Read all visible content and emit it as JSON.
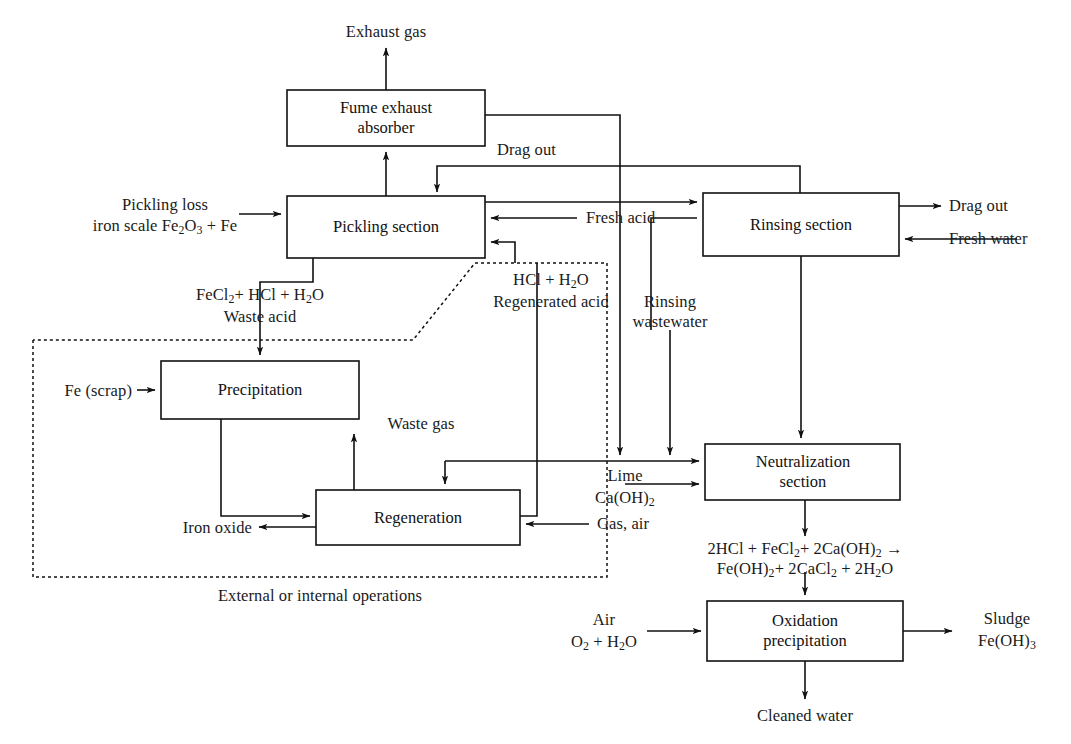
{
  "diagram": {
    "type": "process-flow-diagram",
    "colors": {
      "line": "#111111",
      "text": "#1a1a1a",
      "background": "#ffffff"
    },
    "boxes": [
      {
        "id": "fume-exhaust-absorber",
        "label_line1": "Fume exhaust",
        "label_line2": "absorber",
        "x": 287,
        "y": 90,
        "w": 198,
        "h": 56
      },
      {
        "id": "pickling-section",
        "label_line1": "Pickling section",
        "label_line2": "",
        "x": 287,
        "y": 196,
        "w": 198,
        "h": 62
      },
      {
        "id": "rinsing-section",
        "label_line1": "Rinsing section",
        "label_line2": "",
        "x": 703,
        "y": 193,
        "w": 196,
        "h": 63
      },
      {
        "id": "precipitation",
        "label_line1": "Precipitation",
        "label_line2": "",
        "x": 161,
        "y": 361,
        "w": 198,
        "h": 58
      },
      {
        "id": "regeneration",
        "label_line1": "Regeneration",
        "label_line2": "",
        "x": 316,
        "y": 490,
        "w": 204,
        "h": 55
      },
      {
        "id": "neutralization-section",
        "label_line1": "Neutralization",
        "label_line2": "section",
        "x": 705,
        "y": 444,
        "w": 195,
        "h": 56
      },
      {
        "id": "oxidation-precipitation",
        "label_line1": "Oxidation",
        "label_line2": "precipitation",
        "x": 707,
        "y": 601,
        "w": 196,
        "h": 60
      }
    ],
    "labels": {
      "exhaust_gas": "Exhaust gas",
      "drag_out_top": "Drag out",
      "pickling_loss": "Pickling loss",
      "iron_scale": {
        "pre": "iron scale Fe",
        "sub1": "2",
        "mid": "O",
        "sub2": "3",
        "post": " + Fe"
      },
      "fresh_acid": "Fresh acid",
      "drag_out_right": "Drag out",
      "fresh_water": "Fresh water",
      "waste_acid_formula": {
        "pre": "FeCl",
        "sub1": "2",
        "mid": "+ HCl + H",
        "sub2": "2",
        "post": "O"
      },
      "waste_acid": "Waste acid",
      "regen_acid_formula": {
        "pre": "HCl + H",
        "sub1": "2",
        "post": "O"
      },
      "regenerated_acid": "Regenerated acid",
      "rinsing_wastewater_line1": "Rinsing",
      "rinsing_wastewater_line2": "wastewater",
      "fe_scrap": "Fe (scrap)",
      "waste_gas": "Waste gas",
      "iron_oxide": "Iron oxide",
      "gas_air": "Gas, air",
      "lime": "Lime",
      "lime_formula": {
        "pre": "Ca(OH)",
        "sub1": "2"
      },
      "external_internal": "External or internal operations",
      "neutralization_eq_line1": {
        "pre": "2HCl + FeCl",
        "sub1": "2",
        "mid": "+ 2Ca(OH)",
        "sub2": "2",
        "post": " →"
      },
      "neutralization_eq_line2": {
        "pre": "Fe(OH)",
        "sub1": "2",
        "mid": "+ 2CaCl",
        "sub2": "2",
        "post2": " + 2H",
        "sub3": "2",
        "end": "O"
      },
      "air": "Air",
      "air_formula": {
        "pre": "O",
        "sub1": "2",
        "mid": " + H",
        "sub2": "2",
        "post": "O"
      },
      "sludge": "Sludge",
      "sludge_formula": {
        "pre": "Fe(OH)",
        "sub1": "3"
      },
      "cleaned_water": "Cleaned water"
    },
    "dotted_boundary_label": "External or internal operations"
  }
}
